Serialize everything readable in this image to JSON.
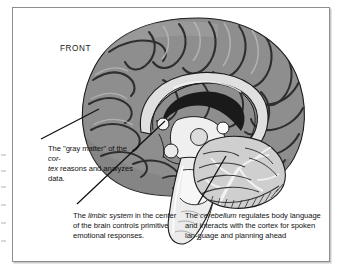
{
  "figure": {
    "type": "anatomical-illustration",
    "orientation_label": "FRONT",
    "style": "grayscale line-and-tone drawing inside a thin rectangular rule",
    "frame_color": "#8d8d8d",
    "background_color": "#ffffff"
  },
  "labels": {
    "front": "FRONT"
  },
  "captions": {
    "cortex": {
      "lead_text": "The \"gray matter\" of the ",
      "emphasis": "cor-\ntex",
      "tail_text": " reasons and analyzes data.",
      "plain": "The \"gray matter\" of the cortex reasons and analyzes data.",
      "points_to": "cerebral-cortex"
    },
    "limbic": {
      "lead_text": "The ",
      "emphasis": "limbic system",
      "tail_text": " in the center of the brain controls primitive emotional responses.",
      "plain": "The limbic system in the center of the brain controls primitive emotional responses.",
      "points_to": "limbic-system"
    },
    "cerebellum": {
      "lead_text": "The ",
      "emphasis": "cerebellum",
      "tail_text": " regulates body language and interacts with the cortex for spoken lan-guage and planning ahead",
      "plain": "The cerebellum regulates body language and interacts with the cortex for spoken language and planning ahead",
      "points_to": "cerebellum"
    }
  },
  "anatomy": {
    "structures": [
      {
        "name": "cerebral-cortex",
        "tone": "medium gray with dark sulci"
      },
      {
        "name": "corpus-callosum",
        "tone": "light gray arc"
      },
      {
        "name": "lateral-ventricle",
        "tone": "near black"
      },
      {
        "name": "thalamus",
        "tone": "pale gray"
      },
      {
        "name": "brainstem",
        "tone": "very light gray"
      },
      {
        "name": "cerebellum",
        "tone": "light gray with fine arbor vitae branching"
      }
    ]
  },
  "colors": {
    "cortex_fill": "#8e8e8e",
    "cortex_shade": "#6f6f6f",
    "sulci_line": "#2e2e2e",
    "callosum_fill": "#e0e0e0",
    "ventricle_fill": "#1a1a1a",
    "brainstem_fill": "#ececec",
    "cerebellum_fill": "#cfcfcf",
    "outline": "#1c1c1c",
    "leader_line": "#111111",
    "text": "#121212"
  }
}
